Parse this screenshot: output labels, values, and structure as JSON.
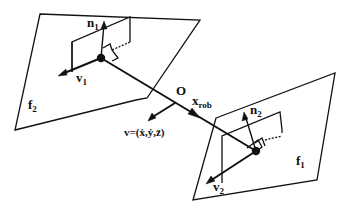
{
  "diagram": {
    "type": "geometric-schematic",
    "colors": {
      "stroke": "#111111",
      "background": "#ffffff"
    },
    "labels": {
      "n1": {
        "base": "n",
        "sub": "1"
      },
      "v1": {
        "base": "v",
        "sub": "1"
      },
      "f2": {
        "base": "f",
        "sub": "2"
      },
      "origin": "O",
      "xrob": {
        "base": "x",
        "sub": "rob"
      },
      "velocity": "v=(ẋ,ẏ,z̈)",
      "n2": {
        "base": "n",
        "sub": "2"
      },
      "v2": {
        "base": "v",
        "sub": "2"
      },
      "f1": {
        "base": "f",
        "sub": "1"
      }
    }
  }
}
